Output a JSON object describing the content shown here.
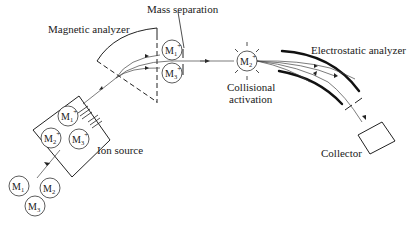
{
  "diagram": {
    "type": "tandem mass spectrometer schematic",
    "labels": {
      "magnetic_analyzer": "Magnetic analyzer",
      "mass_separation": "Mass separation",
      "collisional_activation_line1": "Collisional",
      "collisional_activation_line2": "activation",
      "electrostatic_analyzer": "Electrostatic analyzer",
      "ion_source": "Ion source",
      "collector": "Collector"
    },
    "neutral_molecules": [
      {
        "base": "M",
        "sub": "1"
      },
      {
        "base": "M",
        "sub": "2"
      },
      {
        "base": "M",
        "sub": "3"
      }
    ],
    "ions_in_source": [
      {
        "base": "M",
        "sub": "1",
        "sup": "+"
      },
      {
        "base": "M",
        "sub": "2",
        "sup": "+"
      },
      {
        "base": "M",
        "sub": "3",
        "sup": "+"
      }
    ],
    "separated_ions": [
      {
        "base": "M",
        "sub": "1",
        "sup": "+"
      },
      {
        "base": "M",
        "sub": "3",
        "sup": "+"
      }
    ],
    "selected_ion": {
      "base": "M",
      "sub": "2",
      "sup": "+"
    }
  }
}
